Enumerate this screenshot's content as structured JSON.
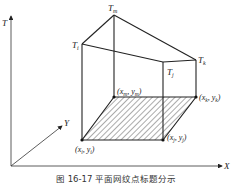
{
  "figure": {
    "caption": "图 16-17  平面网纹点标题分示",
    "axes": {
      "t_label": "T",
      "x_label": "X",
      "y_label": "Y"
    },
    "base_points": {
      "i": "(x",
      "i_label": "(x_i , y_i)",
      "j_label": "(x_j , y_j)",
      "k_label": "(x_k , y_k)",
      "m_label": "(x_m , y_m)"
    },
    "top_points": {
      "i_label": "T",
      "i_sub": "i",
      "j_label": "T",
      "j_sub": "j",
      "k_label": "T",
      "k_sub": "k",
      "m_label": "T",
      "m_sub": "m"
    },
    "coordinate_labels": {
      "i": {
        "x": "x",
        "xsub": "i",
        "y": "y",
        "ysub": "i"
      },
      "j": {
        "x": "x",
        "xsub": "j",
        "y": "y",
        "ysub": "j"
      },
      "k": {
        "x": "x",
        "xsub": "k",
        "y": "y",
        "ysub": "k"
      },
      "m": {
        "x": "x",
        "xsub": "m",
        "y": "y",
        "ysub": "m"
      }
    },
    "colors": {
      "line": "#222222",
      "hatch": "#333333",
      "background": "#ffffff"
    }
  }
}
